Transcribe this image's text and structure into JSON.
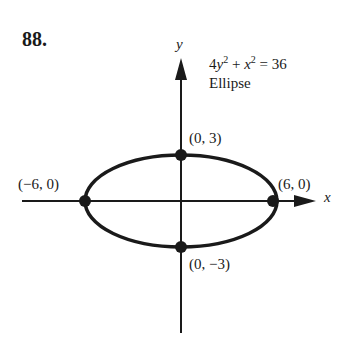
{
  "problem_number": "88.",
  "equation": {
    "lhs_term1_coef": "4",
    "lhs_term1_var": "y",
    "op": "+",
    "lhs_term2_var": "x",
    "exp": "2",
    "equals": "=",
    "rhs": "36"
  },
  "equation_text": "4y² + x² = 36",
  "curve_type": "Ellipse",
  "axes": {
    "x_label": "x",
    "y_label": "y"
  },
  "points": [
    {
      "label": "(0, 3)",
      "x": 0,
      "y": 3
    },
    {
      "label": "(−6, 0)",
      "x": -6,
      "y": 0
    },
    {
      "label": "(6, 0)",
      "x": 6,
      "y": 0
    },
    {
      "label": "(0, −3)",
      "x": 0,
      "y": -3
    }
  ],
  "colors": {
    "ink": "#1a1a1a",
    "background": "#ffffff"
  }
}
